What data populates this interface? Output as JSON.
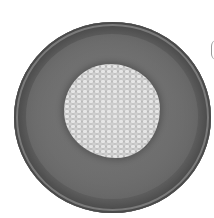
{
  "image": {
    "description": "Grayscale photograph of a round wooden bowl viewed from above containing a pile of small grain kernels",
    "subjects": [
      {
        "name": "wooden-bowl",
        "shape": "circle",
        "color": "#6a6a6a"
      },
      {
        "name": "grain-pile",
        "shape": "irregular-round",
        "color": "#c8c8c8"
      }
    ],
    "background_color": "#ffffff"
  }
}
